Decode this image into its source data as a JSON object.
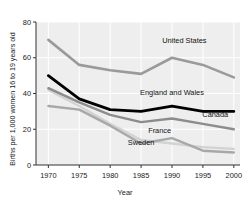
{
  "chart_data": {
    "type": "line",
    "title": "",
    "xlabel": "Year",
    "ylabel": "Births per 1,000 women 16 to 19 years old",
    "x": [
      1970,
      1975,
      1980,
      1985,
      1990,
      1995,
      2000
    ],
    "xticks": [
      "1970",
      "1975",
      "1980",
      "1985",
      "1990",
      "1995",
      "2000"
    ],
    "yticks": [
      "0",
      "20",
      "40",
      "60",
      "80"
    ],
    "xlim": [
      1968,
      2001
    ],
    "ylim": [
      0,
      80
    ],
    "grid": true,
    "legend_position": "inline-labels",
    "series": [
      {
        "name": "United States",
        "color": "#9a9a9a",
        "width": 2.6,
        "values": [
          70,
          56,
          53,
          51,
          60,
          56,
          49
        ],
        "label_x": 1992,
        "label_y": 68
      },
      {
        "name": "England and Wales",
        "color": "#000000",
        "width": 2.8,
        "values": [
          50,
          37,
          31,
          30,
          33,
          30,
          30
        ],
        "label_x": 1990,
        "label_y": 39
      },
      {
        "name": "Canada",
        "color": "#8c8c8c",
        "width": 2.4,
        "values": [
          43,
          35,
          28,
          24,
          26,
          23,
          20
        ],
        "label_x": 1997,
        "label_y": 27
      },
      {
        "name": "France",
        "color": "#d2d2d2",
        "width": 2.4,
        "values": [
          42,
          33,
          23,
          14,
          12,
          10,
          9
        ],
        "label_x": 1988,
        "label_y": 18
      },
      {
        "name": "Sweden",
        "color": "#a8a8a8",
        "width": 2.4,
        "values": [
          33,
          31,
          22,
          12,
          15,
          8,
          7
        ],
        "label_x": 1985,
        "label_y": 11
      }
    ]
  }
}
